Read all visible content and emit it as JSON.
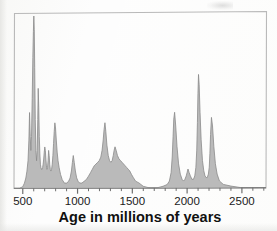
{
  "figure": {
    "name": "age-distribution-density-plot",
    "background_color": "#fdfdfd",
    "frame_color": "#b9b9b9",
    "axis_color": "#6f6f6f"
  },
  "axis": {
    "title": "Age in millions of years",
    "tick_labels": [
      "500",
      "1000",
      "1500",
      "2000",
      "2500"
    ],
    "tick_values": [
      500,
      1000,
      1500,
      2000,
      2500
    ],
    "minor_tick_step": 100
  },
  "chart_data": {
    "type": "area",
    "title": "",
    "subtitle": "",
    "xlabel": "Age in millions of years",
    "ylabel": "",
    "xlim": [
      420,
      2720
    ],
    "ylim": [
      0,
      100
    ],
    "grid": false,
    "legend": null,
    "fill_color": "#b0b0b0",
    "line_color": "#8a8a8a",
    "series": [
      {
        "name": "relative abundance of ages",
        "x": [
          420,
          470,
          500,
          515,
          528,
          538,
          548,
          556,
          562,
          568,
          574,
          580,
          586,
          592,
          597,
          601,
          605,
          609,
          614,
          620,
          626,
          632,
          637,
          641,
          646,
          651,
          656,
          661,
          666,
          671,
          676,
          681,
          686,
          691,
          696,
          701,
          706,
          711,
          716,
          721,
          726,
          731,
          736,
          741,
          746,
          751,
          757,
          763,
          769,
          775,
          781,
          787,
          793,
          799,
          806,
          814,
          822,
          832,
          845,
          860,
          880,
          900,
          918,
          932,
          944,
          953,
          961,
          970,
          980,
          992,
          1005,
          1020,
          1040,
          1060,
          1080,
          1100,
          1118,
          1135,
          1152,
          1168,
          1184,
          1198,
          1212,
          1224,
          1234,
          1242,
          1250,
          1258,
          1268,
          1280,
          1292,
          1304,
          1316,
          1326,
          1334,
          1342,
          1352,
          1364,
          1378,
          1392,
          1406,
          1420,
          1434,
          1448,
          1462,
          1476,
          1492,
          1510,
          1530,
          1560,
          1600,
          1660,
          1720,
          1780,
          1818,
          1838,
          1854,
          1864,
          1872,
          1878,
          1886,
          1896,
          1908,
          1922,
          1938,
          1954,
          1968,
          1980,
          1992,
          2000,
          2008,
          2018,
          2030,
          2044,
          2058,
          2070,
          2080,
          2088,
          2094,
          2099,
          2104,
          2110,
          2118,
          2128,
          2140,
          2152,
          2163,
          2174,
          2184,
          2194,
          2202,
          2208,
          2214,
          2222,
          2232,
          2244,
          2258,
          2274,
          2295,
          2330,
          2400,
          2500,
          2600,
          2720
        ],
        "y": [
          0,
          0,
          1,
          3,
          6,
          10,
          16,
          28,
          44,
          30,
          22,
          30,
          52,
          76,
          91,
          100,
          92,
          70,
          40,
          22,
          16,
          22,
          40,
          58,
          47,
          30,
          20,
          14,
          12,
          11,
          11,
          12,
          14,
          17,
          21,
          24,
          22,
          17,
          13,
          11,
          12,
          16,
          22,
          19,
          14,
          11,
          10,
          11,
          14,
          19,
          26,
          33,
          38,
          35,
          28,
          21,
          16,
          12,
          8,
          5,
          3,
          3,
          4,
          6,
          10,
          15,
          19,
          15,
          10,
          6,
          4,
          3,
          3,
          4,
          5,
          7,
          9,
          11,
          13,
          14,
          15,
          16,
          18,
          22,
          28,
          34,
          38,
          33,
          25,
          19,
          16,
          15,
          16,
          19,
          22,
          24,
          22,
          19,
          17,
          16,
          15,
          14,
          13,
          12,
          11,
          10,
          8,
          6,
          4,
          3,
          1,
          0,
          0,
          1,
          2,
          4,
          9,
          18,
          30,
          40,
          44,
          36,
          24,
          14,
          8,
          5,
          4,
          5,
          7,
          9,
          11,
          9,
          7,
          5,
          5,
          7,
          12,
          22,
          38,
          55,
          66,
          60,
          44,
          28,
          16,
          10,
          7,
          6,
          6,
          8,
          12,
          20,
          31,
          41,
          36,
          24,
          14,
          8,
          4,
          2,
          1,
          0,
          0,
          0
        ]
      }
    ],
    "annotations": [],
    "peak_clusters": [
      {
        "label": "Neoproterozoic-Cambrian cluster",
        "range": [
          500,
          860
        ],
        "peaks": [
          {
            "age": 556,
            "relative_height": 44
          },
          {
            "age": 601,
            "relative_height": 100
          },
          {
            "age": 641,
            "relative_height": 58
          },
          {
            "age": 701,
            "relative_height": 24
          },
          {
            "age": 736,
            "relative_height": 22
          },
          {
            "age": 793,
            "relative_height": 38
          }
        ]
      },
      {
        "label": "Mesoproterozoic cluster",
        "range": [
          880,
          1560
        ],
        "peaks": [
          {
            "age": 961,
            "relative_height": 19
          },
          {
            "age": 1250,
            "relative_height": 38
          },
          {
            "age": 1342,
            "relative_height": 24
          }
        ]
      },
      {
        "label": "Paleoproterozoic cluster",
        "range": [
          1800,
          2300
        ],
        "peaks": [
          {
            "age": 1878,
            "relative_height": 44
          },
          {
            "age": 2000,
            "relative_height": 9
          },
          {
            "age": 2104,
            "relative_height": 66
          },
          {
            "age": 2214,
            "relative_height": 41
          }
        ]
      }
    ]
  }
}
